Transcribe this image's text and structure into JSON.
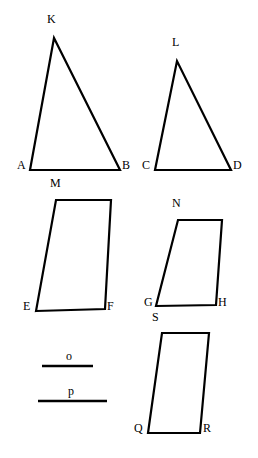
{
  "figure": {
    "width": 258,
    "height": 458,
    "background_color": "#ffffff",
    "stroke_color": "#000000",
    "stroke_width": 2.2
  },
  "shapes": [
    {
      "id": "triangle-abk",
      "name": "triangle-abk",
      "type": "triangle",
      "labels": [
        "A",
        "B",
        "K"
      ],
      "points": "30,170 120,170 54,38",
      "vertices": [
        {
          "label": "A",
          "x": 30,
          "y": 170
        },
        {
          "label": "B",
          "x": 120,
          "y": 170
        },
        {
          "label": "K",
          "x": 54,
          "y": 38
        }
      ]
    },
    {
      "id": "triangle-cdl",
      "name": "triangle-cdl",
      "type": "triangle",
      "labels": [
        "C",
        "D",
        "L"
      ],
      "points": "155,170 231,170 177,61",
      "vertices": [
        {
          "label": "C",
          "x": 155,
          "y": 170
        },
        {
          "label": "D",
          "x": 231,
          "y": 170
        },
        {
          "label": "L",
          "x": 177,
          "y": 61
        }
      ]
    },
    {
      "id": "parallelogram-efm",
      "name": "parallelogram-efm",
      "type": "parallelogram",
      "labels": [
        "E",
        "F",
        "M"
      ],
      "points": "36,311 105,309 111,200 56,200",
      "vertices": [
        {
          "label": "E",
          "x": 36,
          "y": 311
        },
        {
          "label": "F",
          "x": 105,
          "y": 309
        },
        {
          "label": "M",
          "x": 56,
          "y": 200
        }
      ]
    },
    {
      "id": "parallelogram-ghn",
      "name": "parallelogram-ghn",
      "type": "parallelogram",
      "labels": [
        "G",
        "H",
        "N"
      ],
      "points": "156,306 216,305 222,220 178,220",
      "vertices": [
        {
          "label": "G",
          "x": 156,
          "y": 306
        },
        {
          "label": "H",
          "x": 216,
          "y": 305
        },
        {
          "label": "N",
          "x": 178,
          "y": 220
        }
      ]
    },
    {
      "id": "parallelogram-qrs",
      "name": "parallelogram-qrs",
      "type": "parallelogram",
      "labels": [
        "Q",
        "R",
        "S"
      ],
      "points": "148,433 200,433 209,333 162,333",
      "vertices": [
        {
          "label": "Q",
          "x": 148,
          "y": 433
        },
        {
          "label": "R",
          "x": 200,
          "y": 433
        },
        {
          "label": "S",
          "x": 162,
          "y": 333
        }
      ]
    }
  ],
  "segments": [
    {
      "id": "segment-o",
      "name": "segment-o",
      "label": "o",
      "x1": 42,
      "y1": 366,
      "x2": 93,
      "y2": 366,
      "length_px": 51,
      "label_x": 66,
      "label_y": 350
    },
    {
      "id": "segment-p",
      "name": "segment-p",
      "label": "p",
      "x1": 38,
      "y1": 401,
      "x2": 107,
      "y2": 401,
      "length_px": 69,
      "label_x": 68,
      "label_y": 385
    }
  ],
  "vertex_labels": [
    {
      "key": "A",
      "text": "A",
      "x": 17,
      "y": 170
    },
    {
      "key": "B",
      "text": "B",
      "x": 122,
      "y": 170
    },
    {
      "key": "K",
      "text": "K",
      "x": 47,
      "y": 24
    },
    {
      "key": "C",
      "text": "C",
      "x": 142,
      "y": 170
    },
    {
      "key": "D",
      "text": "D",
      "x": 233,
      "y": 170
    },
    {
      "key": "L",
      "text": "L",
      "x": 172,
      "y": 47
    },
    {
      "key": "E",
      "text": "E",
      "x": 23,
      "y": 311
    },
    {
      "key": "F",
      "text": "F",
      "x": 107,
      "y": 311
    },
    {
      "key": "M",
      "text": "M",
      "x": 50,
      "y": 188
    },
    {
      "key": "G",
      "text": "G",
      "x": 144,
      "y": 307
    },
    {
      "key": "H",
      "text": "H",
      "x": 218,
      "y": 307
    },
    {
      "key": "N",
      "text": "N",
      "x": 172,
      "y": 208
    },
    {
      "key": "Q",
      "text": "Q",
      "x": 134,
      "y": 433
    },
    {
      "key": "R",
      "text": "R",
      "x": 203,
      "y": 433
    },
    {
      "key": "S",
      "text": "S",
      "x": 152,
      "y": 322
    }
  ]
}
